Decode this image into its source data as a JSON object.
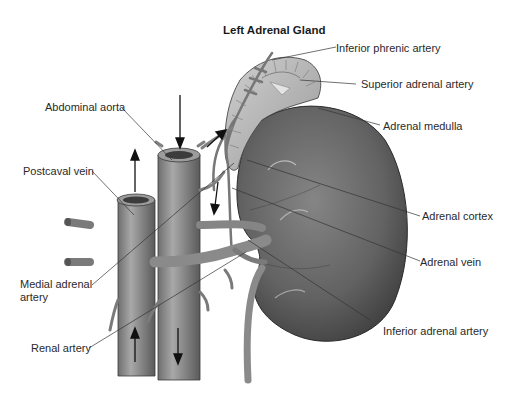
{
  "title": "Left Adrenal Gland",
  "labels": {
    "inferior_phrenic_artery": "Inferior phrenic artery",
    "superior_adrenal_artery": "Superior adrenal artery",
    "adrenal_medulla": "Adrenal medulla",
    "abdominal_aorta": "Abdominal aorta",
    "postcaval_vein": "Postcaval vein",
    "adrenal_cortex": "Adrenal cortex",
    "adrenal_vein": "Adrenal vein",
    "medial_adrenal_artery_line1": "Medial adrenal",
    "medial_adrenal_artery_line2": "artery",
    "renal_artery": "Renal artery",
    "inferior_adrenal_artery": "Inferior adrenal artery"
  },
  "flow_arrows": {
    "postcaval_vein": "up",
    "abdominal_aorta": "down",
    "adrenal_vein": "down",
    "inferior_phrenic": "up-right"
  },
  "colors": {
    "vessel": "#8e8e8e",
    "vessel_dark": "#5c5c5c",
    "kidney": "#6a6a6a",
    "kidney_dark": "#3e3e3e",
    "gland": "#b8b8b8",
    "leader": "#333333"
  }
}
